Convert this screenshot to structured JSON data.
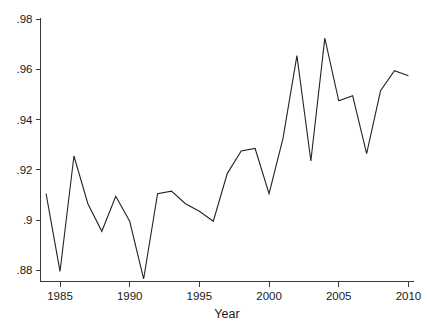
{
  "chart_data": {
    "type": "line",
    "title": "",
    "xlabel": "Year",
    "ylabel": "",
    "grid": false,
    "legend": null,
    "xlim": [
      1983.6,
      2010.4
    ],
    "ylim": [
      0.8755,
      0.9805
    ],
    "xticks": [
      1985,
      1990,
      1995,
      2000,
      2005,
      2010
    ],
    "xtick_labels": [
      "1985",
      "1990",
      "1995",
      "2000",
      "2005",
      "2010"
    ],
    "yticks": [
      0.88,
      0.9,
      0.92,
      0.94,
      0.96,
      0.98
    ],
    "ytick_labels": [
      ".88",
      ".9",
      ".92",
      ".94",
      ".96",
      ".98"
    ],
    "series": [
      {
        "name": "value",
        "x": [
          1984,
          1985,
          1986,
          1987,
          1988,
          1989,
          1990,
          1991,
          1992,
          1993,
          1994,
          1995,
          1996,
          1997,
          1998,
          1999,
          2000,
          2001,
          2002,
          2003,
          2004,
          2005,
          2006,
          2007,
          2008,
          2009,
          2010
        ],
        "values": [
          0.9105,
          0.8795,
          0.9255,
          0.9065,
          0.8955,
          0.9095,
          0.8995,
          0.8765,
          0.9105,
          0.9115,
          0.9065,
          0.9035,
          0.8995,
          0.9185,
          0.9275,
          0.9285,
          0.9105,
          0.9325,
          0.9655,
          0.9235,
          0.9725,
          0.9475,
          0.9495,
          0.9265,
          0.9515,
          0.9595,
          0.9575
        ]
      }
    ]
  },
  "axes": {
    "x_axis_title": "Year"
  },
  "colors": {
    "line": "#242424",
    "axis": "#3a3a3a",
    "text": "#1a1a1a",
    "background": "#ffffff"
  }
}
